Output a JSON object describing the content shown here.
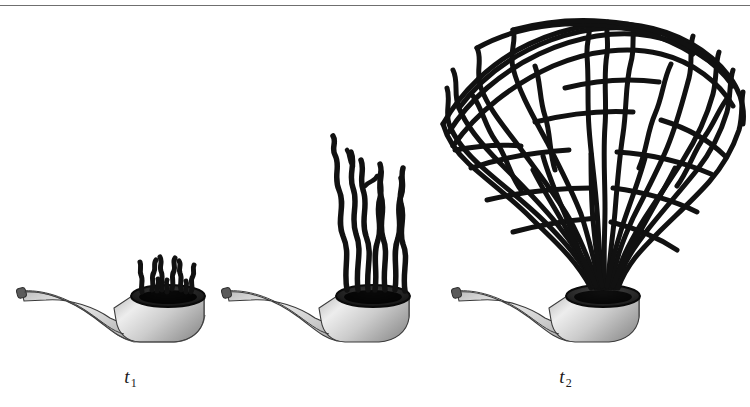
{
  "figure": {
    "background_color": "#ffffff",
    "rule_color": "#6f6f6f",
    "smoke_color": "#111111",
    "pipe_outline_color": "#3a3a3a",
    "pipe_fill_light": "#e8e8e8",
    "pipe_fill_mid": "#b9b9b9",
    "pipe_fill_dark": "#8d8d8d",
    "bowl_rim_color": "#141414"
  },
  "panels": [
    {
      "id": "t1",
      "label_text": "t",
      "label_subscript": "1",
      "smoke_stage": "small wisps",
      "strand_count": 7,
      "smoke_height": 34,
      "description": "pipe with short stubby smoke wisps just above the bowl"
    },
    {
      "id": "t2",
      "label_text": "t",
      "label_subscript": "2",
      "smoke_stage": "tall wavy strands",
      "strand_count": 7,
      "smoke_height": 140,
      "description": "pipe with tall vertical wavy smoke strands rising from the bowl"
    },
    {
      "id": "t3",
      "label_text": "t",
      "label_subscript": "3",
      "smoke_stage": "large spreading cloud",
      "strand_count": 22,
      "smoke_height": 270,
      "description": "pipe with a large dense mushroom-shaped cloud of interwoven smoke strands"
    }
  ]
}
